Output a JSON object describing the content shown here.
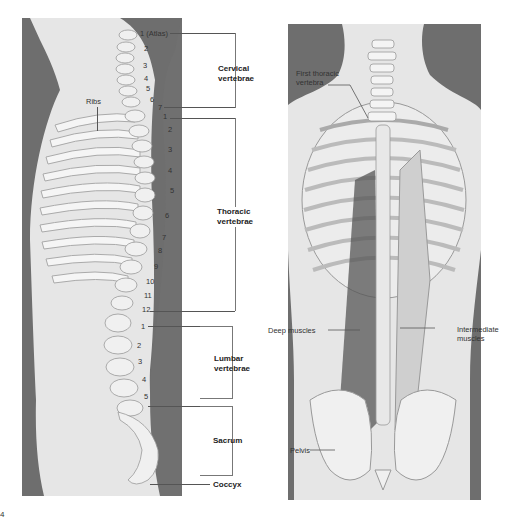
{
  "left_figure": {
    "title": "Lateral view of vertebral column",
    "ribs_label": "Ribs",
    "cervical": {
      "numbers": [
        "1 (Atlas)",
        "2",
        "3",
        "4",
        "5",
        "6",
        "7"
      ],
      "region_label_line1": "Cervical",
      "region_label_line2": "vertebrae"
    },
    "thoracic": {
      "numbers": [
        "1",
        "2",
        "3",
        "4",
        "5",
        "6",
        "7",
        "8",
        "9",
        "10",
        "11",
        "12"
      ],
      "region_label_line1": "Thoracic",
      "region_label_line2": "vertebrae"
    },
    "lumbar": {
      "numbers": [
        "1",
        "2",
        "3",
        "4",
        "5"
      ],
      "region_label_line1": "Lumbar",
      "region_label_line2": "vertebrae"
    },
    "sacrum_label": "Sacrum",
    "coccyx_label": "Coccyx"
  },
  "right_figure": {
    "title": "Posterior view of back",
    "first_thoracic_line1": "First thoracic",
    "first_thoracic_line2": "vertebra",
    "deep_muscles": "Deep muscles",
    "intermediate_line1": "Intermediate",
    "intermediate_line2": "muscles",
    "pelvis": "Pelvis"
  },
  "figure_number": "4",
  "colors": {
    "silhouette": "#6e6e6e",
    "body_fill": "#e6e6e6",
    "bone": "#f4f4f4",
    "muscle": "#555555"
  }
}
